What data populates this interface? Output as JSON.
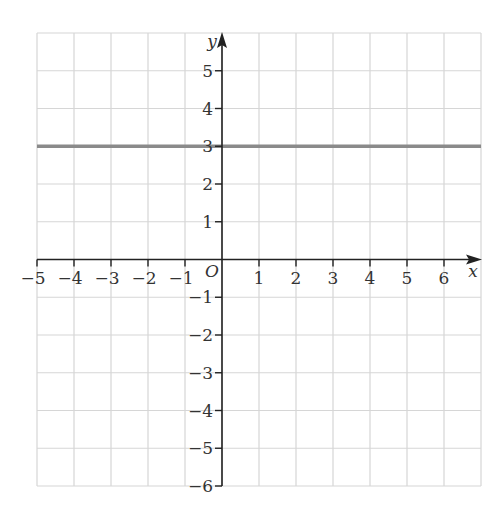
{
  "chart_data": {
    "type": "line",
    "title": "",
    "xlabel": "x",
    "ylabel": "y",
    "origin_label": "O",
    "xlim": [
      -5,
      7
    ],
    "ylim": [
      -6,
      6
    ],
    "grid": true,
    "x_ticks": [
      -5,
      -4,
      -3,
      -2,
      -1,
      1,
      2,
      3,
      4,
      5,
      6
    ],
    "x_tick_labels": [
      "−5",
      "−4",
      "−3",
      "−2",
      "−1",
      "1",
      "2",
      "3",
      "4",
      "5",
      "6"
    ],
    "y_ticks": [
      5,
      4,
      3,
      2,
      1,
      -1,
      -2,
      -3,
      -4,
      -5,
      -6
    ],
    "y_tick_labels": [
      "5",
      "4",
      "3",
      "2",
      "1",
      "−1",
      "−2",
      "−3",
      "−4",
      "−5",
      "−6"
    ],
    "series": [
      {
        "name": "y = 3",
        "x": [
          -5,
          7
        ],
        "y": [
          3,
          3
        ],
        "color": "#8a8a8a"
      }
    ],
    "colors": {
      "grid": "#d6d6d6",
      "axis": "#222222",
      "line": "#8a8a8a"
    }
  }
}
